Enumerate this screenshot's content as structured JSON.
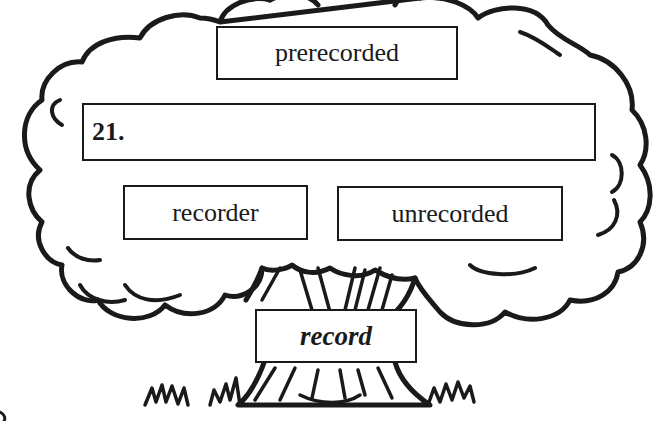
{
  "diagram": {
    "type": "word-tree",
    "root_word": "record",
    "branches": {
      "top": "prerecorded",
      "answer_slot": {
        "number": "21.",
        "value": ""
      },
      "bottom_left": "recorder",
      "bottom_right": "unrecorded"
    }
  },
  "colors": {
    "ink": "#1a1a1a",
    "paper": "#ffffff"
  }
}
